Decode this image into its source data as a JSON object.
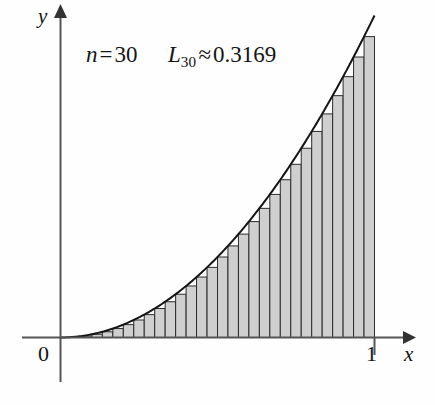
{
  "figure": {
    "name": "riemann-lower-sum-figure",
    "background_color": "#fefefe"
  },
  "annotations": {
    "n_variable": "n",
    "n_equals": "=",
    "n_value": "30",
    "sum_symbol": "L",
    "sum_subscript": "30",
    "approx_symbol": "≈",
    "sum_value": "0.3169"
  },
  "axes": {
    "x_label": "x",
    "y_label": "y",
    "origin_label": "0",
    "x_tick_label": "1",
    "axis_color": "#555555",
    "x_range": [
      0,
      1
    ],
    "y_range": [
      0,
      1
    ]
  },
  "style": {
    "bar_fill": "#cfcfcf",
    "bar_stroke": "#2b2b2b",
    "curve_stroke": "#151515",
    "text_color": "#141414"
  },
  "chart_data": {
    "type": "bar",
    "title": "",
    "subtitle": "",
    "xlabel": "x",
    "ylabel": "y",
    "xlim": [
      0,
      1
    ],
    "ylim": [
      0,
      1
    ],
    "grid": false,
    "legend": "none",
    "annotations": [
      "n = 30",
      "L30 ≈ 0.3169"
    ],
    "function": "y = x^2",
    "n_rectangles": 30,
    "sum_label": "L30",
    "sum_value": 0.3169,
    "curve": {
      "x": [
        0,
        0.05,
        0.1,
        0.15,
        0.2,
        0.25,
        0.3,
        0.35,
        0.4,
        0.45,
        0.5,
        0.55,
        0.6,
        0.65,
        0.7,
        0.75,
        0.8,
        0.85,
        0.9,
        0.95,
        1
      ],
      "y": [
        0,
        0.0025,
        0.01,
        0.0225,
        0.04,
        0.0625,
        0.09,
        0.1225,
        0.16,
        0.2025,
        0.25,
        0.3025,
        0.36,
        0.4225,
        0.49,
        0.5625,
        0.64,
        0.7225,
        0.81,
        0.9025,
        1
      ]
    },
    "categories": [
      "0.0000",
      "0.0333",
      "0.0667",
      "0.1000",
      "0.1333",
      "0.1667",
      "0.2000",
      "0.2333",
      "0.2667",
      "0.3000",
      "0.3333",
      "0.3667",
      "0.4000",
      "0.4333",
      "0.4667",
      "0.5000",
      "0.5333",
      "0.5667",
      "0.6000",
      "0.6333",
      "0.6667",
      "0.7000",
      "0.7333",
      "0.7667",
      "0.8000",
      "0.8333",
      "0.8667",
      "0.9000",
      "0.9333",
      "0.9667"
    ],
    "values": [
      0.0,
      0.0011,
      0.0044,
      0.01,
      0.0178,
      0.0278,
      0.04,
      0.0544,
      0.0711,
      0.09,
      0.1111,
      0.1344,
      0.16,
      0.1878,
      0.2178,
      0.25,
      0.2844,
      0.3211,
      0.36,
      0.4011,
      0.4444,
      0.49,
      0.5378,
      0.5878,
      0.64,
      0.6944,
      0.7511,
      0.81,
      0.8711,
      0.9344
    ],
    "bar_width": 0.03333
  }
}
